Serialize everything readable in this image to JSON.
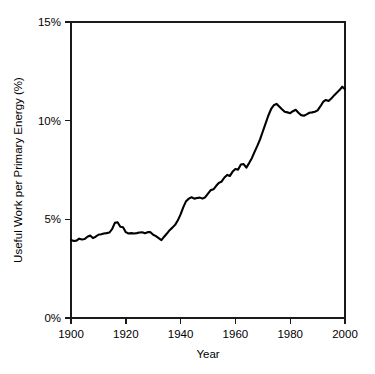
{
  "chart_data": {
    "type": "line",
    "title": "",
    "subtitle": "",
    "xlabel": "Year",
    "ylabel": "Useful Work per Primary Energy (%)",
    "xlim": [
      1900,
      2000
    ],
    "ylim": [
      0,
      15
    ],
    "xticks": [
      1900,
      1920,
      1940,
      1960,
      1980,
      2000
    ],
    "xtick_labels": [
      "1900",
      "1920",
      "1940",
      "1960",
      "1980",
      "2000"
    ],
    "yticks": [
      0,
      5,
      10,
      15
    ],
    "ytick_labels": [
      "0%",
      "5%",
      "10%",
      "15%"
    ],
    "grid": false,
    "legend": null,
    "legend_position": "none",
    "series": [
      {
        "name": "Useful Work per Primary Energy",
        "color": "#000000",
        "x": [
          1900,
          1901,
          1902,
          1903,
          1904,
          1905,
          1906,
          1907,
          1908,
          1909,
          1910,
          1911,
          1912,
          1913,
          1914,
          1915,
          1916,
          1917,
          1918,
          1919,
          1920,
          1921,
          1922,
          1923,
          1924,
          1925,
          1926,
          1927,
          1928,
          1929,
          1930,
          1931,
          1932,
          1933,
          1934,
          1935,
          1936,
          1937,
          1938,
          1939,
          1940,
          1941,
          1942,
          1943,
          1944,
          1945,
          1946,
          1947,
          1948,
          1949,
          1950,
          1951,
          1952,
          1953,
          1954,
          1955,
          1956,
          1957,
          1958,
          1959,
          1960,
          1961,
          1962,
          1963,
          1964,
          1965,
          1966,
          1967,
          1968,
          1969,
          1970,
          1971,
          1972,
          1973,
          1974,
          1975,
          1976,
          1977,
          1978,
          1979,
          1980,
          1981,
          1982,
          1983,
          1984,
          1985,
          1986,
          1987,
          1988,
          1989,
          1990,
          1991,
          1992,
          1993,
          1994,
          1995,
          1996,
          1997,
          1998,
          1999,
          2000
        ],
        "values": [
          3.95,
          3.9,
          3.92,
          4.02,
          3.98,
          4.0,
          4.12,
          4.18,
          4.05,
          4.12,
          4.22,
          4.24,
          4.28,
          4.3,
          4.33,
          4.5,
          4.82,
          4.85,
          4.62,
          4.6,
          4.35,
          4.28,
          4.3,
          4.28,
          4.3,
          4.33,
          4.34,
          4.3,
          4.35,
          4.35,
          4.22,
          4.15,
          4.05,
          3.95,
          4.12,
          4.28,
          4.45,
          4.58,
          4.72,
          4.95,
          5.25,
          5.62,
          5.92,
          6.05,
          6.12,
          6.05,
          6.08,
          6.1,
          6.05,
          6.12,
          6.3,
          6.48,
          6.52,
          6.7,
          6.85,
          6.92,
          7.12,
          7.25,
          7.2,
          7.42,
          7.55,
          7.52,
          7.78,
          7.8,
          7.62,
          7.85,
          8.1,
          8.42,
          8.72,
          9.05,
          9.45,
          9.85,
          10.25,
          10.58,
          10.78,
          10.85,
          10.72,
          10.58,
          10.45,
          10.42,
          10.38,
          10.48,
          10.55,
          10.4,
          10.28,
          10.25,
          10.32,
          10.4,
          10.42,
          10.45,
          10.52,
          10.72,
          10.95,
          11.05,
          11.0,
          11.12,
          11.28,
          11.42,
          11.55,
          11.72,
          11.6
        ]
      }
    ],
    "axis_color": "#1a1a1a",
    "background_color": "#ffffff"
  },
  "figure": {
    "plot_left": 71,
    "plot_right": 345,
    "plot_top": 22,
    "plot_bottom": 318
  }
}
